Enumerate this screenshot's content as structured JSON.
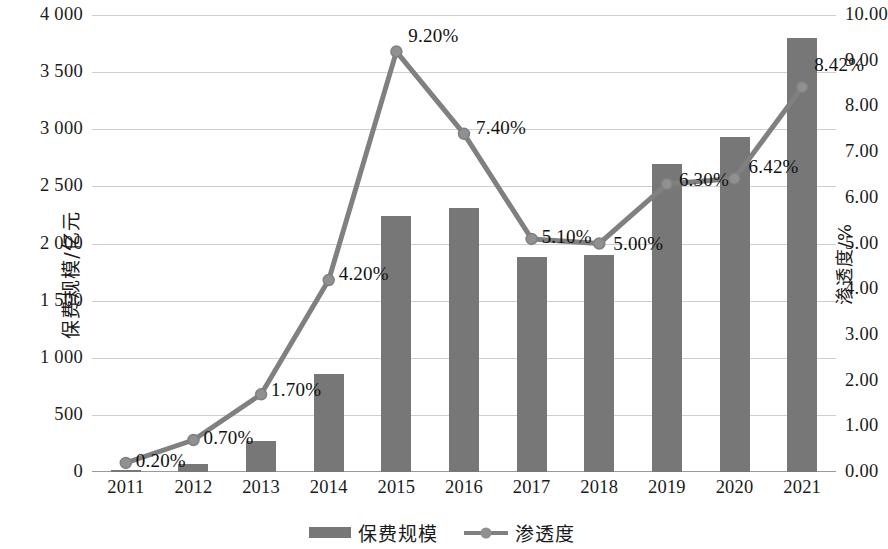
{
  "chart_data": {
    "type": "bar",
    "title": "",
    "subtitle": "",
    "xlabel": "",
    "ylabel": "保费规模/亿元",
    "y2label": "渗透度/%",
    "categories": [
      "2011",
      "2012",
      "2013",
      "2014",
      "2015",
      "2016",
      "2017",
      "2018",
      "2019",
      "2020",
      "2021"
    ],
    "series": [
      {
        "name": "保费规模",
        "type": "bar",
        "axis": "left",
        "unit": "亿元",
        "color": "#777777",
        "values": [
          20,
          70,
          270,
          860,
          2240,
          2310,
          1880,
          1900,
          2700,
          2930,
          3800
        ]
      },
      {
        "name": "渗透度",
        "type": "line",
        "axis": "right",
        "unit": "%",
        "color": "#808080",
        "values": [
          0.2,
          0.7,
          1.7,
          4.2,
          9.2,
          7.4,
          5.1,
          5.0,
          6.3,
          6.42,
          8.42
        ],
        "point_labels": [
          "0.20%",
          "0.70%",
          "1.70%",
          "4.20%",
          "9.20%",
          "7.40%",
          "5.10%",
          "5.00%",
          "6.30%",
          "6.42%",
          "8.42%"
        ]
      }
    ],
    "ylim": [
      0,
      4000
    ],
    "yticks": [
      0,
      500,
      1000,
      1500,
      2000,
      2500,
      3000,
      3500,
      4000
    ],
    "ytick_labels": [
      "0",
      "500",
      "1 000",
      "1 500",
      "2 000",
      "2 500",
      "3 000",
      "3 500",
      "4 000"
    ],
    "y2lim": [
      0,
      10
    ],
    "y2ticks": [
      0,
      1,
      2,
      3,
      4,
      5,
      6,
      7,
      8,
      9,
      10
    ],
    "y2tick_labels": [
      "0.00",
      "1.00",
      "2.00",
      "3.00",
      "4.00",
      "5.00",
      "6.00",
      "7.00",
      "8.00",
      "9.00",
      "10.00"
    ],
    "grid": true,
    "legend_position": "bottom"
  },
  "legend": {
    "items": [
      {
        "label": "保费规模",
        "marker": "bar-swatch"
      },
      {
        "label": "渗透度",
        "marker": "line-marker-swatch"
      }
    ]
  },
  "colors": {
    "bar": "#777777",
    "line": "#808080",
    "marker": "#909090",
    "grid": "#cfcfcf",
    "axis": "#9a9a9a",
    "text": "#111111"
  }
}
